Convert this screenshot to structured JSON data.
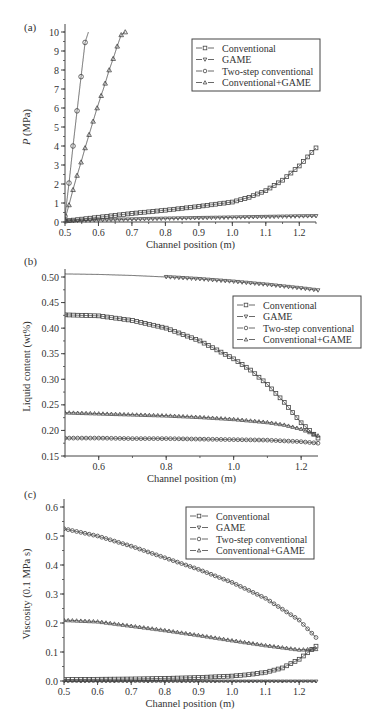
{
  "chart_data": [
    {
      "panel_label": "(a)",
      "type": "line",
      "title": "",
      "xlabel": "Channel position (m)",
      "ylabel": "P (MPa)",
      "xlim": [
        0.5,
        1.25
      ],
      "ylim": [
        0,
        10
      ],
      "x_ticks": [
        0.5,
        0.6,
        0.7,
        0.8,
        0.9,
        1.0,
        1.1,
        1.2
      ],
      "x_tick_labels": [
        "0.5",
        "0.6",
        "0.7",
        "0.8",
        "0.9",
        "1.0",
        "1.1",
        "1.2"
      ],
      "y_ticks": [
        0,
        1,
        2,
        3,
        4,
        5,
        6,
        7,
        8,
        9,
        10
      ],
      "y_tick_labels": [
        "0",
        "1",
        "2",
        "3",
        "4",
        "5",
        "6",
        "7",
        "8",
        "9",
        "10"
      ],
      "grid": false,
      "legend_position": "upper right",
      "series": [
        {
          "name": "Conventional",
          "marker": "square",
          "x": [
            0.5,
            0.6,
            0.7,
            0.8,
            0.9,
            1.0,
            1.05,
            1.1,
            1.15,
            1.2,
            1.25
          ],
          "y": [
            0.05,
            0.25,
            0.45,
            0.62,
            0.82,
            1.05,
            1.3,
            1.65,
            2.2,
            2.95,
            3.9
          ]
        },
        {
          "name": "GAME",
          "marker": "triangle-down",
          "x": [
            0.5,
            0.6,
            0.7,
            0.8,
            0.9,
            1.0,
            1.1,
            1.2,
            1.25
          ],
          "y": [
            0.05,
            0.1,
            0.14,
            0.18,
            0.21,
            0.24,
            0.27,
            0.3,
            0.31
          ]
        },
        {
          "name": "Two-step conventional",
          "marker": "circle",
          "x": [
            0.5,
            0.512,
            0.524,
            0.536,
            0.548,
            0.56,
            0.57
          ],
          "y": [
            0.3,
            2.05,
            4.0,
            5.85,
            7.65,
            9.45,
            10.0
          ]
        },
        {
          "name": "Conventional+GAME",
          "marker": "triangle-up",
          "x": [
            0.5,
            0.512,
            0.524,
            0.536,
            0.548,
            0.56,
            0.572,
            0.584,
            0.596,
            0.608,
            0.62,
            0.632,
            0.644,
            0.656,
            0.668,
            0.68
          ],
          "y": [
            0.15,
            0.9,
            1.7,
            2.45,
            3.15,
            3.9,
            4.6,
            5.3,
            6.0,
            6.65,
            7.3,
            8.0,
            8.6,
            9.25,
            9.85,
            10.0
          ]
        }
      ]
    },
    {
      "panel_label": "(b)",
      "type": "line",
      "title": "",
      "xlabel": "Channel position (m)",
      "ylabel": "Liquid content (wt%)",
      "xlim": [
        0.5,
        1.25
      ],
      "ylim": [
        0.15,
        0.52
      ],
      "x_ticks": [
        0.6,
        0.8,
        1.0,
        1.2
      ],
      "x_tick_labels": [
        "0.6",
        "0.8",
        "1.0",
        "1.2"
      ],
      "y_ticks": [
        0.15,
        0.2,
        0.25,
        0.3,
        0.35,
        0.4,
        0.45,
        0.5
      ],
      "y_tick_labels": [
        "0.15",
        "0.20",
        "0.25",
        "0.30",
        "0.35",
        "0.40",
        "0.45",
        "0.50"
      ],
      "grid": false,
      "legend_position": "center right",
      "series": [
        {
          "name": "Conventional",
          "marker": "square",
          "x": [
            0.5,
            0.6,
            0.7,
            0.8,
            0.9,
            1.0,
            1.05,
            1.1,
            1.15,
            1.2,
            1.25
          ],
          "y": [
            0.426,
            0.424,
            0.415,
            0.4,
            0.375,
            0.34,
            0.318,
            0.29,
            0.255,
            0.215,
            0.185
          ]
        },
        {
          "name": "GAME",
          "marker": "triangle-down",
          "x": [
            0.5,
            0.6,
            0.7,
            0.8,
            0.9,
            1.0,
            1.1,
            1.2,
            1.25
          ],
          "y": [
            0.506,
            0.505,
            0.503,
            0.5,
            0.496,
            0.491,
            0.485,
            0.478,
            0.474
          ]
        },
        {
          "name": "Two-step conventional",
          "marker": "circle",
          "x": [
            0.5,
            0.6,
            0.7,
            0.8,
            0.9,
            1.0,
            1.1,
            1.2,
            1.25
          ],
          "y": [
            0.185,
            0.185,
            0.184,
            0.184,
            0.183,
            0.182,
            0.181,
            0.178,
            0.175
          ]
        },
        {
          "name": "Conventional+GAME",
          "marker": "triangle-up",
          "x": [
            0.5,
            0.6,
            0.7,
            0.8,
            0.9,
            1.0,
            1.1,
            1.15,
            1.2,
            1.25
          ],
          "y": [
            0.235,
            0.233,
            0.231,
            0.229,
            0.226,
            0.222,
            0.216,
            0.211,
            0.203,
            0.19
          ]
        }
      ]
    },
    {
      "panel_label": "(c)",
      "type": "line",
      "title": "",
      "xlabel": "Channel position (m)",
      "ylabel": "Viscosity (0.1 MPa s)",
      "xlim": [
        0.5,
        1.25
      ],
      "ylim": [
        -0.01,
        0.65
      ],
      "x_ticks": [
        0.5,
        0.6,
        0.7,
        0.8,
        0.9,
        1.0,
        1.1,
        1.2
      ],
      "x_tick_labels": [
        "0.5",
        "0.6",
        "0.7",
        "0.8",
        "0.9",
        "1.0",
        "1.1",
        "1.2"
      ],
      "y_ticks": [
        0.0,
        0.1,
        0.2,
        0.3,
        0.4,
        0.5,
        0.6
      ],
      "y_tick_labels": [
        "0.0",
        "0.1",
        "0.2",
        "0.3",
        "0.4",
        "0.5",
        "0.6"
      ],
      "grid": false,
      "legend_position": "upper right",
      "series": [
        {
          "name": "Conventional",
          "marker": "square",
          "x": [
            0.5,
            0.6,
            0.7,
            0.8,
            0.9,
            1.0,
            1.05,
            1.1,
            1.15,
            1.2,
            1.25
          ],
          "y": [
            0.005,
            0.006,
            0.007,
            0.009,
            0.012,
            0.017,
            0.022,
            0.03,
            0.045,
            0.075,
            0.12
          ]
        },
        {
          "name": "GAME",
          "marker": "triangle-down",
          "x": [
            0.5,
            0.7,
            0.9,
            1.1,
            1.25
          ],
          "y": [
            -0.002,
            -0.002,
            -0.002,
            -0.002,
            -0.002
          ]
        },
        {
          "name": "Two-step conventional",
          "marker": "circle",
          "x": [
            0.5,
            0.6,
            0.7,
            0.8,
            0.9,
            1.0,
            1.1,
            1.2,
            1.25
          ],
          "y": [
            0.525,
            0.5,
            0.465,
            0.425,
            0.385,
            0.34,
            0.285,
            0.21,
            0.15
          ]
        },
        {
          "name": "Conventional+GAME",
          "marker": "triangle-up",
          "x": [
            0.5,
            0.6,
            0.7,
            0.8,
            0.9,
            1.0,
            1.1,
            1.2,
            1.25
          ],
          "y": [
            0.21,
            0.205,
            0.19,
            0.175,
            0.158,
            0.14,
            0.123,
            0.108,
            0.11
          ]
        }
      ]
    }
  ],
  "legend": {
    "items": [
      {
        "label": "Conventional",
        "marker": "square"
      },
      {
        "label": "GAME",
        "marker": "triangle-down"
      },
      {
        "label": "Two-step conventional",
        "marker": "circle"
      },
      {
        "label": "Conventional+GAME",
        "marker": "triangle-up"
      }
    ]
  },
  "colors": {
    "line": "#444444",
    "text": "#333333",
    "background": "#ffffff"
  }
}
